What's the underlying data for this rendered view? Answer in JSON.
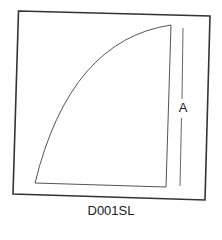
{
  "diagram": {
    "caption": "D001SL",
    "dimension_label": "A",
    "colors": {
      "frame": "#333333",
      "shape": "#555555",
      "dimension_line": "#666666",
      "text": "#222222"
    }
  }
}
